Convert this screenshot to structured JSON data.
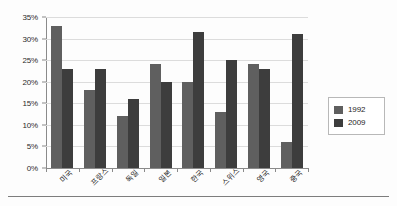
{
  "chart_data": {
    "type": "bar",
    "title": "",
    "subtitle": "",
    "xlabel": "",
    "ylabel": "",
    "categories": [
      "미국",
      "프랑스",
      "독일",
      "일본",
      "한국",
      "스위스",
      "영국",
      "중국"
    ],
    "series": [
      {
        "name": "1992",
        "values": [
          33,
          18,
          12,
          24,
          20,
          13,
          24,
          6
        ],
        "color": "#5f5f5f"
      },
      {
        "name": "2009",
        "values": [
          23,
          23,
          16,
          20,
          31.5,
          25,
          23,
          31
        ],
        "color": "#3d3d3d"
      }
    ],
    "ylim": [
      0,
      35
    ],
    "ytick_values": [
      0,
      5,
      10,
      15,
      20,
      25,
      30,
      35
    ],
    "ytick_labels": [
      "0%",
      "5%",
      "10%",
      "15%",
      "20%",
      "25%",
      "30%",
      "35%"
    ],
    "grid": true,
    "grid_axis": "y",
    "legend_position": "right",
    "legend_entries": [
      "1992",
      "2009"
    ],
    "annotations": []
  },
  "legend": {
    "entries": [
      {
        "label": "1992"
      },
      {
        "label": "2009"
      }
    ]
  }
}
